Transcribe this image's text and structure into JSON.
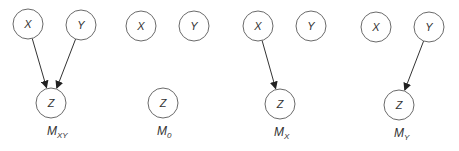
{
  "diagram": {
    "panels": [
      {
        "id": "mxy",
        "label_main": "M",
        "label_sub": "XY",
        "nodes": {
          "x": {
            "label": "X",
            "cx": 28,
            "cy": 24
          },
          "y": {
            "label": "Y",
            "cx": 81,
            "cy": 25
          },
          "z": {
            "label": "Z",
            "cx": 51,
            "cy": 103
          }
        },
        "edges": [
          [
            "x",
            "z"
          ],
          [
            "y",
            "z"
          ]
        ],
        "label_pos": {
          "x": 47,
          "y": 135
        }
      },
      {
        "id": "m0",
        "label_main": "M",
        "label_sub": "0",
        "nodes": {
          "x": {
            "label": "X",
            "cx": 141,
            "cy": 26
          },
          "y": {
            "label": "Y",
            "cx": 194,
            "cy": 26
          },
          "z": {
            "label": "Z",
            "cx": 163,
            "cy": 103
          }
        },
        "edges": [],
        "label_pos": {
          "x": 157,
          "y": 135
        }
      },
      {
        "id": "mx",
        "label_main": "M",
        "label_sub": "X",
        "nodes": {
          "x": {
            "label": "X",
            "cx": 258,
            "cy": 26
          },
          "y": {
            "label": "Y",
            "cx": 311,
            "cy": 26
          },
          "z": {
            "label": "Z",
            "cx": 280,
            "cy": 104
          }
        },
        "edges": [
          [
            "x",
            "z"
          ]
        ],
        "label_pos": {
          "x": 274,
          "y": 136
        }
      },
      {
        "id": "my",
        "label_main": "M",
        "label_sub": "Y",
        "nodes": {
          "x": {
            "label": "X",
            "cx": 376,
            "cy": 27
          },
          "y": {
            "label": "Y",
            "cx": 429,
            "cy": 27
          },
          "z": {
            "label": "Z",
            "cx": 399,
            "cy": 105
          }
        },
        "edges": [
          [
            "y",
            "z"
          ]
        ],
        "label_pos": {
          "x": 394,
          "y": 137
        }
      }
    ],
    "node_radius": 15,
    "colors": {
      "stroke": "#6a6a6a",
      "edge": "#333333",
      "text": "#333333"
    }
  }
}
